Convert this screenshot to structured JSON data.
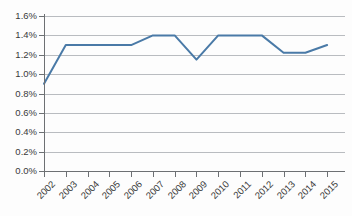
{
  "chart_data": {
    "type": "line",
    "title": "",
    "subtitle": "",
    "xlabel": "",
    "ylabel": "",
    "categories": [
      "2002",
      "2003",
      "2004",
      "2005",
      "2006",
      "2007",
      "2008",
      "2009",
      "2010",
      "2011",
      "2012",
      "2013",
      "2014",
      "2015"
    ],
    "values": [
      0.9,
      1.3,
      1.3,
      1.3,
      1.3,
      1.4,
      1.4,
      1.15,
      1.4,
      1.4,
      1.4,
      1.22,
      1.22,
      1.3
    ],
    "series": [
      {
        "name": "",
        "values": [
          0.9,
          1.3,
          1.3,
          1.3,
          1.3,
          1.4,
          1.4,
          1.15,
          1.4,
          1.4,
          1.4,
          1.22,
          1.22,
          1.3
        ]
      }
    ],
    "ylim": [
      0.0,
      1.6
    ],
    "ytick_values": [
      0.0,
      0.2,
      0.4,
      0.6,
      0.8,
      1.0,
      1.2,
      1.4,
      1.6
    ],
    "ytick_labels": [
      "0.0%",
      "0.2%",
      "0.4%",
      "0.6%",
      "0.8%",
      "1.0%",
      "1.2%",
      "1.4%",
      "1.6%"
    ],
    "xtick_labels": [
      "2002",
      "2003",
      "2004",
      "2005",
      "2006",
      "2007",
      "2008",
      "2009",
      "2010",
      "2011",
      "2012",
      "2013",
      "2014",
      "2015"
    ],
    "grid": true,
    "grid_axis": "y",
    "legend": false,
    "legend_position": "none",
    "annotations": [],
    "value_format": "percent",
    "colors": {
      "line": "#4a7aa7",
      "gridline": "#b9bcc0",
      "axis": "#6d7073",
      "text": "#3a3a3a",
      "background": "#fdfdfd"
    }
  }
}
